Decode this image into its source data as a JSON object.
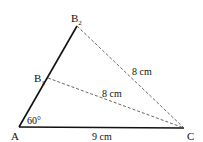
{
  "diagram": {
    "type": "geometry-triangle",
    "points": {
      "A": {
        "label": "A",
        "x": 19,
        "y": 127
      },
      "B1": {
        "label": "B",
        "sub": "1",
        "x": 48,
        "y": 78
      },
      "B2": {
        "label": "B",
        "sub": "2",
        "x": 77,
        "y": 26
      },
      "C": {
        "label": "C",
        "x": 184,
        "y": 128
      }
    },
    "segments": [
      {
        "from": "A",
        "to": "B2",
        "style": "solid-thick"
      },
      {
        "from": "A",
        "to": "C",
        "style": "solid-thick",
        "label": "9 cm"
      },
      {
        "from": "B1",
        "to": "C",
        "style": "dashed",
        "label": "8 cm"
      },
      {
        "from": "B2",
        "to": "C",
        "style": "dashed",
        "label": "8 cm"
      }
    ],
    "angle": {
      "vertex": "A",
      "label": "60°"
    },
    "labels": {
      "A": "A",
      "B": "B",
      "C": "C",
      "sub1": "1",
      "sub2": "2",
      "angle": "60°",
      "ac_length": "9 cm",
      "b1c_length": "8 cm",
      "b2c_length": "8 cm"
    },
    "colors": {
      "line": "#111111",
      "dashed": "#555555",
      "background": "#ffffff"
    }
  }
}
